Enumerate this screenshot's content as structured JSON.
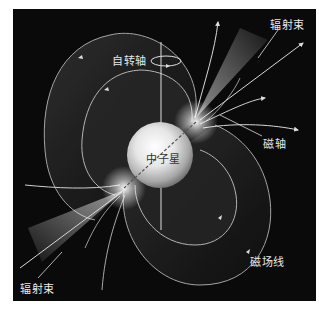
{
  "diagram": {
    "title": "中子星",
    "background_color": "#0a0a0a",
    "labels": {
      "spin_axis": "自转轴",
      "radiation_beam_top": "辐射束",
      "magnetic_axis": "磁轴",
      "neutron_star": "中子星",
      "field_lines": "磁场线",
      "radiation_beam_bottom": "辐射束"
    }
  }
}
